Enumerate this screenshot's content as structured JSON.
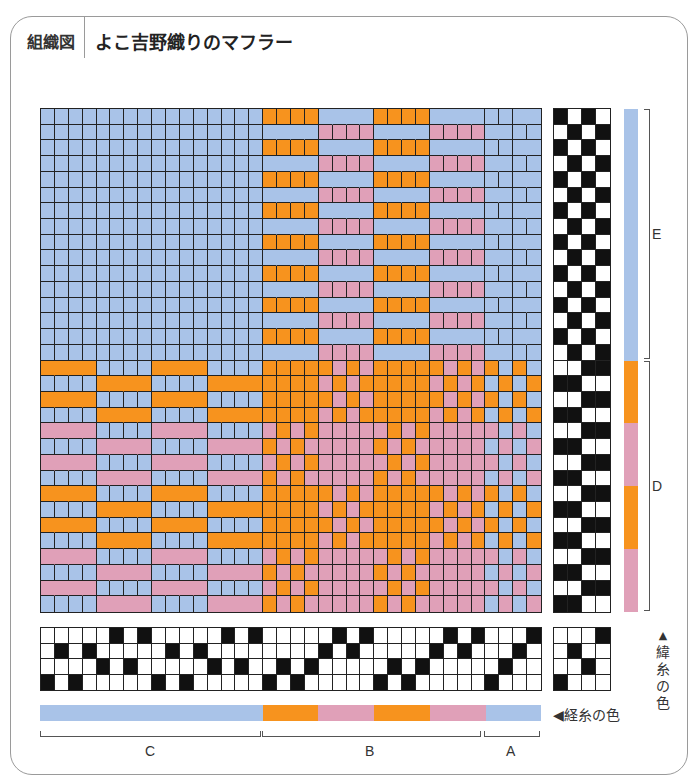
{
  "header": {
    "tag": "組織図",
    "title": "よこ吉野織りのマフラー"
  },
  "colors": {
    "blue": "#A9C3E8",
    "orange": "#F7931E",
    "pink": "#E0A0B8",
    "black": "#111111",
    "white": "#ffffff",
    "grid_line": "#222222"
  },
  "draft": {
    "warp_count": 36,
    "weft_count": 32,
    "shafts": 4,
    "treadles": 4,
    "threading_top_row_index": [
      3,
      1,
      3,
      1,
      2,
      0,
      2,
      0,
      3,
      1,
      3,
      1,
      2,
      0,
      2,
      0,
      3,
      2,
      3,
      2,
      1,
      0,
      1,
      0,
      3,
      2,
      3,
      2,
      1,
      0,
      1,
      0,
      3,
      2,
      1,
      0
    ],
    "tieup_rows": [
      [
        0,
        0,
        0,
        1
      ],
      [
        0,
        1,
        0,
        0
      ],
      [
        0,
        0,
        1,
        0
      ],
      [
        1,
        0,
        0,
        0
      ]
    ],
    "treadling_rows_pattern": {
      "E": [
        [
          1,
          0,
          1,
          0
        ],
        [
          0,
          1,
          0,
          1
        ]
      ],
      "D": [
        [
          0,
          0,
          1,
          1
        ],
        [
          1,
          1,
          0,
          0
        ]
      ]
    },
    "treadling_sections": [
      {
        "section": "E",
        "rows": 16
      },
      {
        "section": "D",
        "rows": 16
      }
    ],
    "warp_colors": [
      "blue",
      "blue",
      "blue",
      "blue",
      "blue",
      "blue",
      "blue",
      "blue",
      "blue",
      "blue",
      "blue",
      "blue",
      "blue",
      "blue",
      "blue",
      "blue",
      "orange",
      "orange",
      "orange",
      "orange",
      "pink",
      "pink",
      "pink",
      "pink",
      "orange",
      "orange",
      "orange",
      "orange",
      "pink",
      "pink",
      "pink",
      "pink",
      "blue",
      "blue",
      "blue",
      "blue"
    ],
    "weft_colors": [
      "blue",
      "blue",
      "blue",
      "blue",
      "blue",
      "blue",
      "blue",
      "blue",
      "blue",
      "blue",
      "blue",
      "blue",
      "blue",
      "blue",
      "blue",
      "blue",
      "orange",
      "orange",
      "orange",
      "orange",
      "pink",
      "pink",
      "pink",
      "pink",
      "orange",
      "orange",
      "orange",
      "orange",
      "pink",
      "pink",
      "pink",
      "pink"
    ]
  },
  "labels": {
    "weft_sections": [
      {
        "label": "E"
      },
      {
        "label": "D"
      }
    ],
    "warp_sections": [
      {
        "label": "C"
      },
      {
        "label": "B"
      },
      {
        "label": "A"
      }
    ],
    "weft_color_label": "▲緯糸の色",
    "warp_color_label": "◀経糸の色"
  }
}
